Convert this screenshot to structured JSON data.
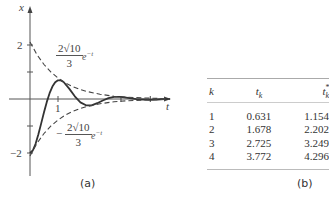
{
  "figure_a": {
    "caption": "(a)",
    "y_axis_label": "x",
    "x_axis_label": "t",
    "y_ticks": [
      {
        "value": 2,
        "label": "2"
      },
      {
        "value": 1,
        "label": ""
      },
      {
        "value": -1,
        "label": ""
      },
      {
        "value": -2,
        "label": "−2"
      }
    ],
    "x_ticks": [
      {
        "value": 1,
        "label": "1"
      }
    ],
    "upper_envelope_label": {
      "numerator": "2√10",
      "denominator": "3",
      "factor": "e",
      "exponent": "−t"
    },
    "lower_envelope_label": {
      "sign": "−",
      "numerator": "2√10",
      "denominator": "3",
      "factor": "e",
      "exponent": "−t"
    }
  },
  "chart_data": {
    "type": "line",
    "title": "",
    "xlabel": "t",
    "ylabel": "x",
    "xlim": [
      0,
      5
    ],
    "ylim": [
      -2.5,
      2.5
    ],
    "grid": false,
    "series": [
      {
        "name": "x(t)",
        "style": "solid",
        "t": [
          0,
          0.1,
          0.2,
          0.3,
          0.4,
          0.5,
          0.6,
          0.7,
          0.8,
          0.9,
          1.0,
          1.1,
          1.2,
          1.4,
          1.6,
          1.8,
          2.0,
          2.2,
          2.4,
          2.6,
          2.8,
          3.0,
          3.25,
          3.5,
          3.8,
          4.05,
          4.3,
          4.55,
          4.8,
          5.0
        ],
        "x": [
          -2.0,
          -1.907,
          -1.66,
          -1.308,
          -0.903,
          -0.491,
          -0.107,
          0.215,
          0.461,
          0.619,
          0.694,
          0.69,
          0.629,
          0.385,
          0.099,
          -0.125,
          -0.234,
          -0.234,
          -0.157,
          -0.057,
          0.029,
          0.077,
          0.082,
          0.044,
          -0.004,
          -0.02,
          -0.029,
          -0.018,
          0.0,
          0.008
        ]
      },
      {
        "name": "2√10/3 e^−t",
        "style": "dashed",
        "t": [
          0,
          0.25,
          0.5,
          0.75,
          1.0,
          1.25,
          1.5,
          1.75,
          2.0,
          2.5,
          3.0,
          3.5,
          4.0,
          4.5,
          5.0
        ],
        "x": [
          2.108,
          1.642,
          1.279,
          0.996,
          0.776,
          0.604,
          0.47,
          0.366,
          0.285,
          0.173,
          0.105,
          0.064,
          0.039,
          0.023,
          0.014
        ]
      },
      {
        "name": "−2√10/3 e^−t",
        "style": "dashed",
        "t": [
          0,
          0.25,
          0.5,
          0.75,
          1.0,
          1.25,
          1.5,
          1.75,
          2.0,
          2.5,
          3.0,
          3.5,
          4.0,
          4.5,
          5.0
        ],
        "x": [
          -2.108,
          -1.642,
          -1.279,
          -0.996,
          -0.776,
          -0.604,
          -0.47,
          -0.366,
          -0.285,
          -0.173,
          -0.105,
          -0.064,
          -0.039,
          -0.023,
          -0.014
        ]
      }
    ],
    "table": {
      "columns": [
        "k",
        "t_k",
        "t*_k"
      ],
      "rows": [
        [
          1,
          0.631,
          1.154
        ],
        [
          2,
          1.678,
          2.202
        ],
        [
          3,
          2.725,
          3.249
        ],
        [
          4,
          3.772,
          4.296
        ]
      ]
    }
  },
  "figure_b": {
    "caption": "(b)",
    "headers": {
      "k": "k",
      "tk_base": "t",
      "tk_sub": "k",
      "tks_base": "t",
      "tks_sub": "k",
      "tks_sup": "*"
    },
    "rows": [
      {
        "k": "1",
        "tk": "0.631",
        "tks": "1.154"
      },
      {
        "k": "2",
        "tk": "1.678",
        "tks": "2.202"
      },
      {
        "k": "3",
        "tk": "2.725",
        "tks": "3.249"
      },
      {
        "k": "4",
        "tk": "3.772",
        "tks": "4.296"
      }
    ]
  }
}
